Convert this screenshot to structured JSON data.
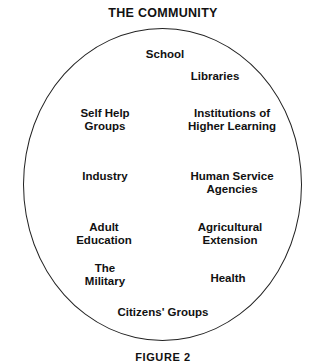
{
  "diagram": {
    "title": "THE COMMUNITY",
    "caption": "FIGURE 2",
    "shape": "circle",
    "outline_color": "#222222",
    "background_color": "#ffffff",
    "text_color": "#111111",
    "members": [
      {
        "label": "School",
        "cx": 165,
        "top": 48
      },
      {
        "label": "Libraries",
        "cx": 215,
        "top": 70
      },
      {
        "label": "Self Help\nGroups",
        "cx": 105,
        "top": 107
      },
      {
        "label": "Institutions of\nHigher Learning",
        "cx": 232,
        "top": 107
      },
      {
        "label": "Industry",
        "cx": 105,
        "top": 170
      },
      {
        "label": "Human Service\nAgencies",
        "cx": 232,
        "top": 170
      },
      {
        "label": "Adult\nEducation",
        "cx": 104,
        "top": 221
      },
      {
        "label": "Agricultural\nExtension",
        "cx": 230,
        "top": 221
      },
      {
        "label": "The\nMilitary",
        "cx": 105,
        "top": 262
      },
      {
        "label": "Health",
        "cx": 228,
        "top": 272
      },
      {
        "label": "Citizens' Groups",
        "cx": 163,
        "top": 306
      }
    ]
  }
}
